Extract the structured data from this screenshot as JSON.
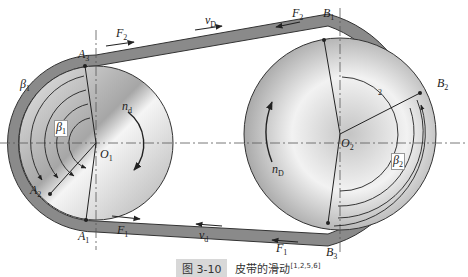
{
  "diagram": {
    "type": "belt-drive-slip",
    "colors": {
      "belt": "#8a8a8a",
      "belt_edge": "#333333",
      "pulley_light": "#f4f4f4",
      "pulley_dark": "#9a9a9a",
      "centerline": "#555555"
    },
    "labels": {
      "F2_top_left": "F",
      "F2_top_left_sub": "2",
      "vD": "v",
      "vD_sub": "D",
      "F2_top_right": "F",
      "F2_top_right_sub": "2",
      "B1": "B",
      "B1_sub": "1",
      "B2": "B",
      "B2_sub": "2",
      "B3": "B",
      "B3_sub": "3",
      "A1": "A",
      "A1_sub": "1",
      "A2": "A",
      "A2_sub": "2",
      "A3": "A",
      "A3_sub": "3",
      "beta1_outer": "β",
      "beta1_outer_sub": "1",
      "beta1_inner": "β",
      "beta1_inner_sub": "1",
      "beta2": "β",
      "beta2_sub": "2",
      "O1": "O",
      "O1_sub": "1",
      "O2": "O",
      "O2_sub": "2",
      "nd": "n",
      "nd_sub": "d",
      "nD": "n",
      "nD_sub": "D",
      "F1_bottom_left": "F",
      "F1_bottom_left_sub": "1",
      "vd": "v",
      "vd_sub": "d",
      "F1_bottom_right": "F",
      "F1_bottom_right_sub": "1",
      "small_2": "2"
    }
  },
  "caption": {
    "figure_tag": "图 3-10",
    "title": "皮带的滑动",
    "refs": "[1,2,5,6]"
  }
}
